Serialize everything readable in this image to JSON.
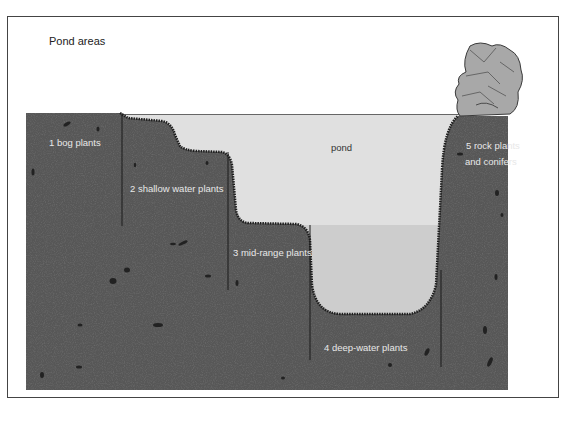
{
  "title": "Pond areas",
  "labels": {
    "pond": "pond",
    "zone1": "1 bog plants",
    "zone2": "2 shallow water plants",
    "zone3": "3 mid-range plants",
    "zone4": "4 deep-water plants",
    "zone5_line1": "5 rock plants",
    "zone5_line2": "and conifers"
  },
  "colors": {
    "soil": "#555555",
    "soil_speckle": "#2a2a2a",
    "water_upper": "#e0e0e0",
    "water_lower": "#cdcdcd",
    "rock": "#a9a9a9",
    "frame": "#444444"
  }
}
